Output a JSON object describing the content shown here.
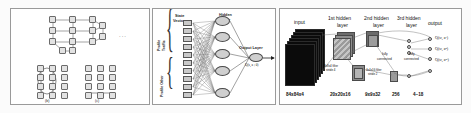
{
  "figure": {
    "panel_a": {
      "caption_b": "(b)",
      "caption_c": "(c)",
      "dots": "···",
      "node_count_top": 11,
      "node_count_grid": 24
    },
    "panel_b": {
      "state_vector_label": "State\nVector s",
      "state_vector_line1": "State",
      "state_vector_line2": "Vector s",
      "hidden_layer_label": "Hidden\nLayer",
      "hidden_layer_line1": "Hidden",
      "hidden_layer_line2": "Layer",
      "output_layer_label": "Output Layer",
      "output_equation": "Q(s, a ; θ)",
      "group_traffic": "Traffic\nProfile",
      "group_traffic_line1": "Traffic",
      "group_traffic_line2": "Profile",
      "group_profile": "Profile Other",
      "input_unit_labels": [
        "x1",
        "x2",
        "x3",
        "x4",
        "x5",
        "x6",
        "x7",
        "x8",
        "x9",
        "x10"
      ],
      "input_units": 10,
      "hidden_units": 5,
      "output_units": 1
    },
    "panel_c": {
      "layer_labels": [
        {
          "id": "input",
          "line1": "input",
          "line2": ""
        },
        {
          "id": "hidden1",
          "line1": "1st hidden",
          "line2": "layer"
        },
        {
          "id": "hidden2",
          "line1": "2nd hidden",
          "line2": "layer"
        },
        {
          "id": "hidden3",
          "line1": "3rd hidden",
          "line2": "layer"
        },
        {
          "id": "output",
          "line1": "output",
          "line2": ""
        }
      ],
      "dimension_labels": [
        "84x84x4",
        "20x20x16",
        "9x9x32",
        "256",
        "4~18"
      ],
      "filter1": {
        "line1": "8x8x4 filter",
        "line2": "stride 4"
      },
      "filter2": {
        "line1": "4x4x16 filter",
        "line2": "stride 2"
      },
      "fully_connected_1": {
        "line1": "fully",
        "line2": "connected"
      },
      "fully_connected_2": {
        "line1": "fully",
        "line2": "connected"
      },
      "q_outputs": [
        "Q(sₜ, a¹)",
        "Q(sₜ, a²)",
        "Q(sₜ, aᵐ)"
      ],
      "input_frames": 6
    },
    "colors": {
      "panel_border": "#9a9a9a",
      "node_fill": "#e2e2e2",
      "node_stroke": "#6b6b6b",
      "neuron_fill": "#cfcfcf",
      "frame_fill": "#0b0b0b",
      "background": "#ffffff"
    }
  }
}
